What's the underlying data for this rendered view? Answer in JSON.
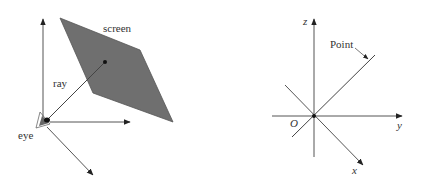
{
  "left_diagram": {
    "labels": {
      "screen": "screen",
      "ray": "ray",
      "eye": "eye"
    },
    "colors": {
      "screen_fill": "#6f6f6f",
      "line": "#444444",
      "eye_fill": "#555555"
    }
  },
  "right_diagram": {
    "labels": {
      "z_axis": "z",
      "y_axis": "y",
      "x_axis": "x",
      "origin": "O",
      "point": "Point"
    },
    "colors": {
      "line": "#444444"
    }
  }
}
